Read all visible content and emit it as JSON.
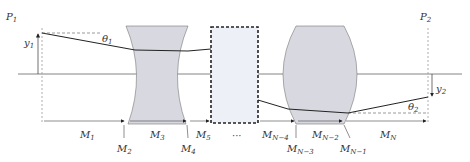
{
  "diagram": {
    "planes": {
      "input": "P",
      "input_sub": "1",
      "output": "P",
      "output_sub": "2"
    },
    "heights": {
      "y1": "y",
      "y1_sub": "1",
      "y2": "y",
      "y2_sub": "2"
    },
    "angles": {
      "t1": "θ",
      "t1_sub": "1",
      "t2": "θ",
      "t2_sub": "2"
    },
    "ellipsis": "···",
    "matrices": [
      {
        "m": "M",
        "s": "1"
      },
      {
        "m": "M",
        "s": "2"
      },
      {
        "m": "M",
        "s": "3"
      },
      {
        "m": "M",
        "s": "4"
      },
      {
        "m": "M",
        "s": "5"
      },
      {
        "m": "M",
        "s": "N−4"
      },
      {
        "m": "M",
        "s": "N−3"
      },
      {
        "m": "M",
        "s": "N−2"
      },
      {
        "m": "M",
        "s": "N−1"
      },
      {
        "m": "M",
        "s": "N"
      }
    ],
    "colors": {
      "lens_fill": "#d8d8e0",
      "box_fill": "#eef0f8",
      "line": "#222222",
      "axis": "#555555"
    }
  }
}
